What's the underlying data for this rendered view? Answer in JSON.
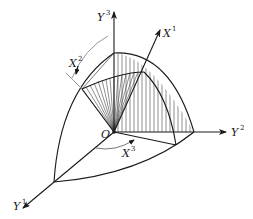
{
  "figure": {
    "type": "coordinate-frame-diagram",
    "origin_label": "O",
    "axes": {
      "fixed": [
        {
          "id": "Y1",
          "base": "Y",
          "index": "1"
        },
        {
          "id": "Y2",
          "base": "Y",
          "index": "2"
        },
        {
          "id": "Y3",
          "base": "Y",
          "index": "3"
        }
      ],
      "rotated": [
        {
          "id": "X1",
          "base": "X",
          "index": "1"
        },
        {
          "id": "X2",
          "base": "X",
          "index": "2"
        },
        {
          "id": "X3",
          "base": "X",
          "index": "3"
        }
      ]
    },
    "colors": {
      "ink": "#1a1a1a",
      "guide": "#8a8a8a",
      "background": "#ffffff"
    }
  }
}
